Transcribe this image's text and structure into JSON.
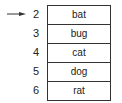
{
  "pointer": {
    "target_index": "2"
  },
  "rows": [
    {
      "index": "2",
      "value": "bat"
    },
    {
      "index": "3",
      "value": "bug"
    },
    {
      "index": "4",
      "value": "cat"
    },
    {
      "index": "5",
      "value": "dog"
    },
    {
      "index": "6",
      "value": "rat"
    }
  ]
}
